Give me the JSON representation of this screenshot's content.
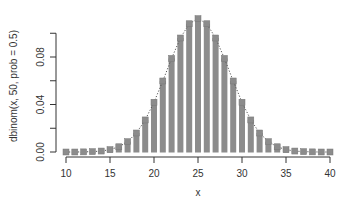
{
  "chart_data": {
    "type": "bar",
    "title": "",
    "xlabel": "x",
    "ylabel": "dbinom(x, 50, prob = 0.5)",
    "x": [
      10,
      11,
      12,
      13,
      14,
      15,
      16,
      17,
      18,
      19,
      20,
      21,
      22,
      23,
      24,
      25,
      26,
      27,
      28,
      29,
      30,
      31,
      32,
      33,
      34,
      35,
      36,
      37,
      38,
      39,
      40
    ],
    "values": [
      0.0,
      0.0,
      0.0001,
      0.0003,
      0.0008,
      0.002,
      0.0044,
      0.0087,
      0.016,
      0.027,
      0.0419,
      0.0598,
      0.0788,
      0.096,
      0.108,
      0.1123,
      0.108,
      0.096,
      0.0788,
      0.0598,
      0.0419,
      0.027,
      0.016,
      0.0087,
      0.0044,
      0.002,
      0.0008,
      0.0003,
      0.0001,
      0.0,
      0.0
    ],
    "xlim": [
      10,
      40
    ],
    "ylim": [
      0,
      0.115
    ],
    "x_ticks": [
      10,
      15,
      20,
      25,
      30,
      35,
      40
    ],
    "y_ticks": [
      0.0,
      0.02,
      0.04,
      0.06,
      0.08,
      0.1
    ],
    "y_tick_labels": [
      "0.00",
      "",
      "0.04",
      "",
      "0.08",
      ""
    ],
    "grid": false,
    "legend": null,
    "overlay": "dotted line connecting bar tops with square point markers",
    "colors": {
      "bar": "#8c8c8c",
      "marker": "#8c8c8c",
      "line": "#555555",
      "axis": "#333333"
    }
  }
}
